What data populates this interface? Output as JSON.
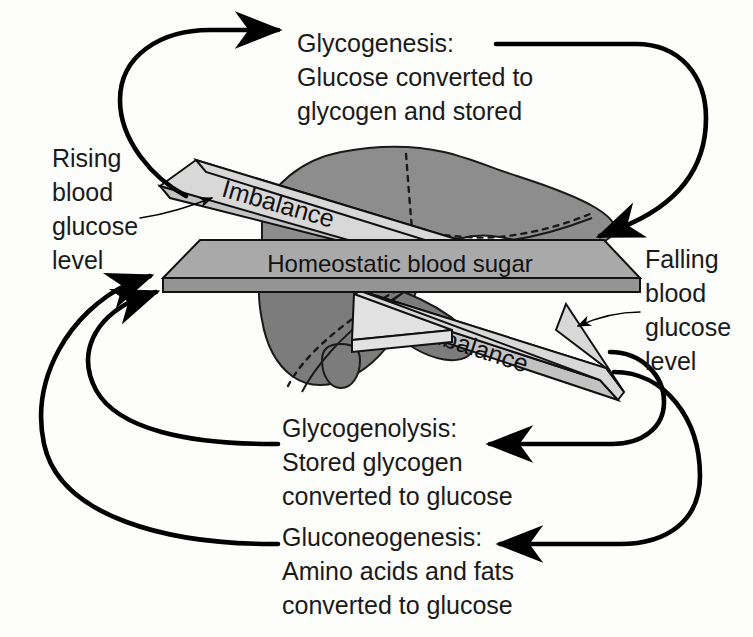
{
  "diagram": {
    "colors": {
      "background": "#fdfdfb",
      "ink": "#000000",
      "organ": "#8d8d8d",
      "beam": "#a9a9a9",
      "imbalance_plank": "#d8d8d8",
      "wedge": "#e2e2e2"
    },
    "central_beam": {
      "label": "Homeostatic blood sugar"
    },
    "imbalance_planks": [
      {
        "label": "Imbalance",
        "position": "upper-left"
      },
      {
        "label": "Imbalance",
        "position": "lower-right"
      }
    ],
    "side_labels": [
      {
        "id": "rising",
        "lines": [
          "Rising",
          "blood",
          "glucose",
          "level"
        ]
      },
      {
        "id": "falling",
        "lines": [
          "Falling",
          "blood",
          "glucose",
          "level"
        ]
      }
    ],
    "processes": [
      {
        "id": "glycogenesis",
        "heading": "Glycogenesis:",
        "body": [
          "Glucose converted to",
          "glycogen and stored"
        ]
      },
      {
        "id": "glycogenolysis",
        "heading": "Glycogenolysis:",
        "body": [
          "Stored glycogen",
          "converted to glucose"
        ]
      },
      {
        "id": "gluconeogenesis",
        "heading": "Gluconeogenesis:",
        "body": [
          "Amino acids and fats",
          "converted to glucose"
        ]
      }
    ]
  }
}
